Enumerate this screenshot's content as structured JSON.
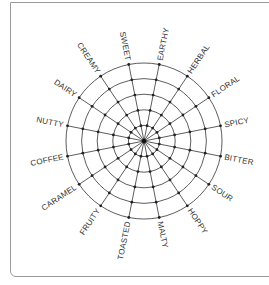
{
  "chart_data": {
    "type": "radar",
    "title": "",
    "categories": [
      "SWEET",
      "EARTHY",
      "HERBAL",
      "FLORAL",
      "SPICY",
      "BITTER",
      "SOUR",
      "HOPPY",
      "MALTY",
      "TOASTED",
      "FRUITY",
      "CARAMEL",
      "COFFEE",
      "NUTTY",
      "DAIRY",
      "CREAMY"
    ],
    "rings": 5,
    "grid": true,
    "series": [],
    "start_angle_deg": -101.25,
    "marker_at_intersections": true
  },
  "layout": {
    "cx": 144,
    "cy": 141,
    "radius": 78,
    "label_offset": 4
  },
  "colors": {
    "grid": "#333333",
    "label": "#333333",
    "border": "#9a9a9a"
  }
}
